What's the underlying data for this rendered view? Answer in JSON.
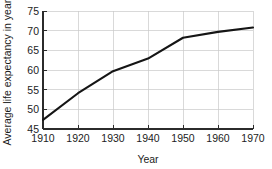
{
  "chart_data": {
    "type": "line",
    "title": "",
    "xlabel": "Year",
    "ylabel": "Average life expectancy in years",
    "x": [
      1910,
      1920,
      1930,
      1940,
      1950,
      1960,
      1970
    ],
    "values": [
      47.3,
      54.1,
      59.7,
      62.9,
      68.2,
      69.7,
      70.8
    ],
    "series": [
      {
        "name": "Average life expectancy",
        "values": [
          47.3,
          54.1,
          59.7,
          62.9,
          68.2,
          69.7,
          70.8
        ]
      }
    ],
    "xticks": [
      "1910",
      "1920",
      "1930",
      "1940",
      "1950",
      "1960",
      "1970"
    ],
    "yticks": [
      "45",
      "50",
      "55",
      "60",
      "65",
      "70",
      "75"
    ],
    "xlim": [
      1910,
      1970
    ],
    "ylim": [
      45,
      75
    ],
    "grid": true,
    "legend": false,
    "legend_position": "none",
    "line_color": "#151515",
    "grid_color": "#c9c9c9",
    "axis_color": "#2b2b2b",
    "background_color": "#ffffff"
  },
  "axes": {
    "x_title": "Year",
    "y_title": "Average life expectancy in years"
  },
  "y_tick_labels": {
    "t0": "45",
    "t1": "50",
    "t2": "55",
    "t3": "60",
    "t4": "65",
    "t5": "70",
    "t6": "75"
  },
  "x_tick_labels": {
    "t0": "1910",
    "t1": "1920",
    "t2": "1930",
    "t3": "1940",
    "t4": "1950",
    "t5": "1960",
    "t6": "1970"
  }
}
